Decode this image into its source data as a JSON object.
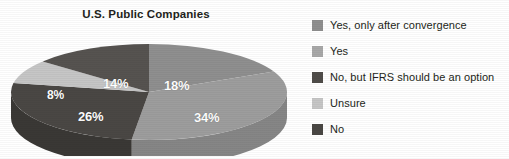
{
  "chart_data": {
    "type": "pie",
    "title": "U.S. Public Companies",
    "xlabel": "",
    "ylabel": "",
    "legend_position": "right",
    "grid": false,
    "three_d": true,
    "categories": [
      "Yes, only after convergence",
      "Yes",
      "No, but IFRS should be an option",
      "Unsure",
      "No"
    ],
    "values": [
      18,
      34,
      26,
      8,
      14
    ],
    "value_labels": [
      "18%",
      "34%",
      "26%",
      "8%",
      "14%"
    ],
    "colors": [
      "#8f8f8f",
      "#9d9d9d",
      "#4a4744",
      "#c6c6c6",
      "#565350"
    ],
    "side_colors": [
      "#7a7a7a",
      "#868686",
      "#3a3835",
      "#a9a9a9",
      "#444240"
    ],
    "slices": [
      {
        "label": "Yes, only after convergence",
        "value": 18,
        "display": "18%",
        "color": "#8f8f8f"
      },
      {
        "label": "Yes",
        "value": 34,
        "display": "34%",
        "color": "#9d9d9d"
      },
      {
        "label": "No, but IFRS should be an option",
        "value": 26,
        "display": "26%",
        "color": "#4a4744"
      },
      {
        "label": "Unsure",
        "value": 8,
        "display": "8%",
        "color": "#c6c6c6"
      },
      {
        "label": "No",
        "value": 14,
        "display": "14%",
        "color": "#565350"
      }
    ]
  },
  "legend": {
    "items": [
      {
        "label": "Yes, only after convergence",
        "color": "#8f8f8f"
      },
      {
        "label": "Yes",
        "color": "#a8a8a8"
      },
      {
        "label": "No, but IFRS should be an option",
        "color": "#4f4c49"
      },
      {
        "label": "Unsure",
        "color": "#c6c6c6"
      },
      {
        "label": "No",
        "color": "#4a4744"
      }
    ]
  }
}
